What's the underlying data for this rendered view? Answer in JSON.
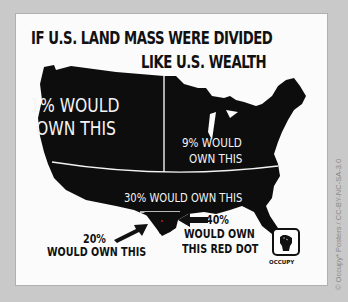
{
  "poster": {
    "title_line1": "IF U.S. LAND MASS WERE DIVIDED",
    "title_line2": "LIKE U.S. WEALTH",
    "regions": [
      {
        "id": "west",
        "label_line1": "1% WOULD",
        "label_line2": "OWN THIS",
        "share": "1%"
      },
      {
        "id": "east",
        "label_line1": "9% WOULD",
        "label_line2": "OWN THIS",
        "share": "9%"
      },
      {
        "id": "south",
        "label": "30% WOULD OWN THIS",
        "share": "30%"
      },
      {
        "id": "texas",
        "label_line1": "20%",
        "label_line2": "WOULD OWN THIS",
        "share": "20%"
      },
      {
        "id": "red-dot",
        "label_line1": "40%",
        "label_line2": "WOULD OWN",
        "label_line3": "THIS RED DOT",
        "share": "40%"
      }
    ],
    "logo_text": "OCCUPY",
    "colors": {
      "map": "#0d0d0d",
      "background": "#fbfbfb",
      "dot": "#c0141a",
      "page": "#c9c9c9"
    }
  },
  "credit": "© Occupy* Posters / CC-BY-NC-SA-3.0"
}
